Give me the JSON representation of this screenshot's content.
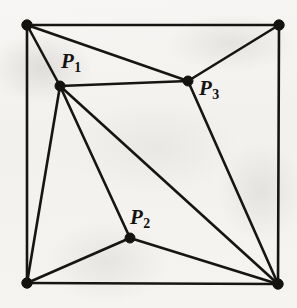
{
  "figure": {
    "kind": "planar-triangulation-diagram",
    "width": 297,
    "height": 308,
    "colors": {
      "ink": "#15130f",
      "paper": "#f4f3f1",
      "ghost_text": "#b9b6b0"
    },
    "vertices": [
      {
        "id": "TL",
        "label": "",
        "x": 27,
        "y": 25,
        "kind": "corner"
      },
      {
        "id": "TR",
        "label": "",
        "x": 279,
        "y": 25,
        "kind": "corner"
      },
      {
        "id": "BL",
        "label": "",
        "x": 27,
        "y": 283,
        "kind": "corner"
      },
      {
        "id": "BR",
        "label": "",
        "x": 278,
        "y": 284,
        "kind": "corner"
      },
      {
        "id": "P1",
        "label": "P",
        "sub": "1",
        "x": 60,
        "y": 86,
        "kind": "interior"
      },
      {
        "id": "P2",
        "label": "P",
        "sub": "2",
        "x": 130,
        "y": 238,
        "kind": "interior"
      },
      {
        "id": "P3",
        "label": "P",
        "sub": "3",
        "x": 188,
        "y": 81,
        "kind": "interior"
      }
    ],
    "edges": [
      {
        "from": "TL",
        "to": "TR",
        "name": "top-border"
      },
      {
        "from": "TR",
        "to": "BR",
        "name": "right-border"
      },
      {
        "from": "BR",
        "to": "BL",
        "name": "bottom-border"
      },
      {
        "from": "BL",
        "to": "TL",
        "name": "left-border"
      },
      {
        "from": "TL",
        "to": "P1",
        "name": "edge-tl-p1"
      },
      {
        "from": "TL",
        "to": "P3",
        "name": "edge-tl-p3"
      },
      {
        "from": "TR",
        "to": "P3",
        "name": "edge-tr-p3"
      },
      {
        "from": "P1",
        "to": "P3",
        "name": "edge-p1-p3"
      },
      {
        "from": "P1",
        "to": "BL",
        "name": "edge-p1-bl"
      },
      {
        "from": "P1",
        "to": "P2",
        "name": "edge-p1-p2"
      },
      {
        "from": "P1",
        "to": "BR",
        "name": "edge-p1-br"
      },
      {
        "from": "P2",
        "to": "BL",
        "name": "edge-p2-bl"
      },
      {
        "from": "P2",
        "to": "BR",
        "name": "edge-p2-br"
      },
      {
        "from": "P3",
        "to": "BR",
        "name": "edge-p3-br"
      }
    ],
    "labels": {
      "p1": {
        "base": "P",
        "sub": "1"
      },
      "p2": {
        "base": "P",
        "sub": "2"
      },
      "p3": {
        "base": "P",
        "sub": "3"
      }
    },
    "ghost_text": {
      "line1": "",
      "line2": "",
      "line3": ""
    }
  }
}
